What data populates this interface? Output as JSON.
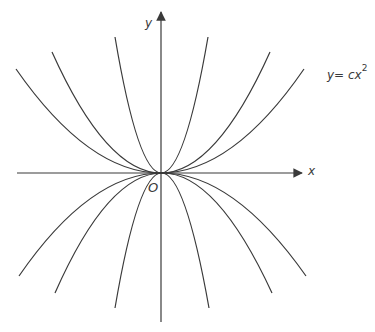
{
  "diagram": {
    "axes": {
      "x_label": "x",
      "y_label": "y",
      "origin_label": "O"
    },
    "equation": {
      "lhs": "y",
      "eq": "= ",
      "coef": "c",
      "var": "x",
      "exp": "2"
    },
    "curves": [
      {
        "c_sign": "positive",
        "steepness": "shallow"
      },
      {
        "c_sign": "positive",
        "steepness": "medium"
      },
      {
        "c_sign": "positive",
        "steepness": "steep"
      },
      {
        "c_sign": "negative",
        "steepness": "shallow"
      },
      {
        "c_sign": "negative",
        "steepness": "medium"
      },
      {
        "c_sign": "negative",
        "steepness": "steep"
      }
    ],
    "colors": {
      "stroke": "#3a3a3a",
      "background": "#ffffff"
    }
  }
}
